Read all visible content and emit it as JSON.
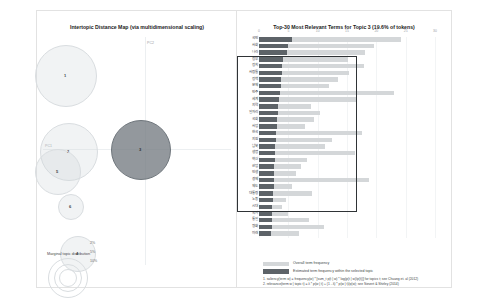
{
  "left": {
    "title": "Intertopic Distance Map (via multidimensional scaling)",
    "axis": {
      "x": "PC1",
      "y": "PC2"
    },
    "marginal": {
      "title": "Marginal topic distribution",
      "sizes": [
        "2%",
        "5%",
        "10%"
      ]
    }
  },
  "right": {
    "title": "Top-30 Most Relevant Terms for Topic 3 (19.6% of tokens)",
    "legend": {
      "overall": "Overall term frequency",
      "estimated": "Estimated term frequency within the selected topic"
    },
    "footnotes": [
      "1. saliency(term w) = frequency(w) * [sum_t p(t | w) * log(p(t | w)/p(t))] for topics t; see Chuang et. al (2012)",
      "2. relevance(term w | topic t) = λ * p(w | t) + (1 - λ) * p(w | t)/p(w); see Sievert & Shirley (2014)"
    ]
  },
  "chart_data": {
    "type": "bar",
    "title": "Top-30 Most Relevant Terms for Topic 3 (19.6% of tokens)",
    "orientation": "horizontal",
    "xlabel": "",
    "ylabel": "",
    "xlim": [
      0,
      30
    ],
    "xticks": [
      0,
      5,
      10,
      15,
      20,
      25,
      30
    ],
    "grid": true,
    "legend_position": "bottom-left",
    "selected_topic": 3,
    "selected_topic_tokens_pct": 19.6,
    "categories": [
      "국민",
      "사회",
      "나라",
      "정부",
      "정치",
      "사람들",
      "정책",
      "문제",
      "민주",
      "세계",
      "지역",
      "일자리",
      "국회",
      "사업",
      "한국",
      "지원",
      "남북",
      "생명",
      "혁신",
      "산업",
      "인생",
      "경제",
      "제도",
      "대통령",
      "노동",
      "시대",
      "국가",
      "통일",
      "평화",
      "미래"
    ],
    "series": [
      {
        "name": "Overall term frequency",
        "color": "#d4d7d9",
        "values": [
          24.2,
          19.6,
          18.0,
          15.1,
          17.9,
          15.4,
          13.5,
          11.9,
          23.0,
          16.7,
          8.9,
          10.4,
          9.3,
          7.9,
          17.6,
          12.4,
          11.2,
          16.3,
          8.2,
          7.1,
          6.3,
          18.8,
          5.6,
          9.0,
          4.6,
          3.9,
          4.9,
          8.5,
          11.0,
          6.8
        ]
      },
      {
        "name": "Estimated term frequency within the selected topic",
        "color": "#5d6368",
        "values": [
          5.6,
          5.0,
          4.7,
          4.1,
          4.0,
          3.9,
          3.8,
          3.7,
          3.6,
          3.4,
          3.3,
          3.2,
          3.1,
          3.0,
          2.9,
          2.9,
          2.8,
          2.8,
          2.7,
          2.6,
          2.6,
          2.5,
          2.5,
          2.4,
          2.4,
          2.3,
          2.3,
          2.2,
          2.2,
          2.1
        ]
      }
    ],
    "highlight_box": {
      "from_index": 3,
      "to_index": 25
    }
  },
  "topics": [
    {
      "id": "1",
      "x": 28,
      "y": 44,
      "r": 30,
      "selected": false
    },
    {
      "id": "2",
      "x": 31,
      "y": 120,
      "r": 28,
      "selected": false
    },
    {
      "id": "5",
      "x": 20,
      "y": 140,
      "r": 22,
      "selected": false
    },
    {
      "id": "6",
      "x": 33,
      "y": 175,
      "r": 12,
      "selected": false
    },
    {
      "id": "4",
      "x": 40,
      "y": 222,
      "r": 17,
      "selected": false
    },
    {
      "id": "3",
      "x": 103,
      "y": 118,
      "r": 29,
      "selected": true
    }
  ]
}
